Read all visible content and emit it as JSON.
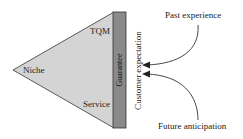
{
  "diagram": {
    "colors": {
      "triangle_fill": "#d4d4d4",
      "bar_fill": "#8a8a8a",
      "stroke": "#333333",
      "text": "#222222"
    },
    "triangle": {
      "labels": {
        "top": "TQM",
        "left": "Niche",
        "bottom": "Service"
      }
    },
    "bar": {
      "label": "Guarantee"
    },
    "vertical_label": "Customer expectation",
    "inputs": [
      {
        "label": "Past experience",
        "position": "top"
      },
      {
        "label": "Future anticipation",
        "position": "bottom"
      }
    ]
  }
}
